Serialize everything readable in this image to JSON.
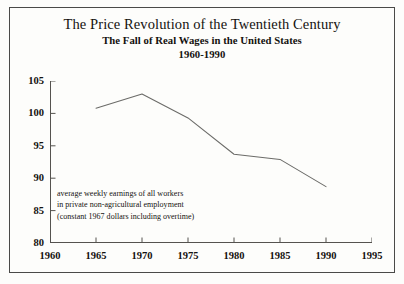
{
  "figure": {
    "background_color": "#fdfdfb",
    "border_color": "#4a4a48",
    "text_color": "#14120f",
    "line_color": "#6b6b68"
  },
  "chart_data": {
    "type": "line",
    "title": "The Price Revolution of the Twentieth Century",
    "subtitle": "The Fall of Real Wages in the United States",
    "date_range": "1960-1990",
    "xlabel": "",
    "ylabel": "",
    "xlim": [
      1960,
      1995
    ],
    "ylim": [
      80,
      105
    ],
    "xticks": [
      1960,
      1965,
      1970,
      1975,
      1980,
      1985,
      1990,
      1995
    ],
    "xtick_labels": [
      "1960",
      "1965",
      "1970",
      "1975",
      "1980",
      "1985",
      "1990",
      "1995"
    ],
    "yticks": [
      80,
      85,
      90,
      95,
      100,
      105
    ],
    "ytick_labels": [
      "80",
      "85",
      "90",
      "95",
      "100",
      "105"
    ],
    "grid": false,
    "legend": false,
    "x": [
      1965,
      1970,
      1975,
      1980,
      1985,
      1990
    ],
    "values": [
      100.8,
      103.0,
      99.3,
      93.7,
      92.9,
      88.7
    ],
    "series": [
      {
        "name": "average weekly earnings of all workers",
        "x": [
          1965,
          1970,
          1975,
          1980,
          1985,
          1990
        ],
        "values": [
          100.8,
          103.0,
          99.3,
          93.7,
          92.9,
          88.7
        ]
      }
    ],
    "annotation_lines": [
      "average weekly earnings of all workers",
      "in private non-agricultural  employment",
      "(constant 1967 dollars including overtime)"
    ]
  }
}
